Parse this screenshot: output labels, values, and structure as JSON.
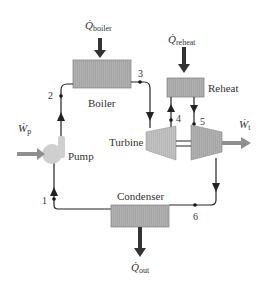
{
  "diagram": {
    "colors": {
      "component_fill": "#a9a9a9",
      "turbine_fill": "#b9b9b9",
      "pump_fill": "#cfcfcf",
      "heat_arrow": "#333333",
      "work_arrow": "#8f8f8f",
      "line": "#222222"
    },
    "components": {
      "boiler": "Boiler",
      "reheat": "Reheat",
      "turbine": "Turbine",
      "pump": "Pump",
      "condenser": "Condenser"
    },
    "energy_flows": {
      "q_boiler": {
        "symbol": "Q̇",
        "sub": "boiler"
      },
      "q_reheat": {
        "symbol": "Q̇",
        "sub": "reheat"
      },
      "q_out": {
        "symbol": "Q̇",
        "sub": "out"
      },
      "w_pump": {
        "symbol": "Ẇ",
        "sub": "p"
      },
      "w_turbine": {
        "symbol": "Ẇ",
        "sub": "t"
      }
    },
    "state_points": [
      "1",
      "2",
      "3",
      "4",
      "5",
      "6"
    ]
  }
}
